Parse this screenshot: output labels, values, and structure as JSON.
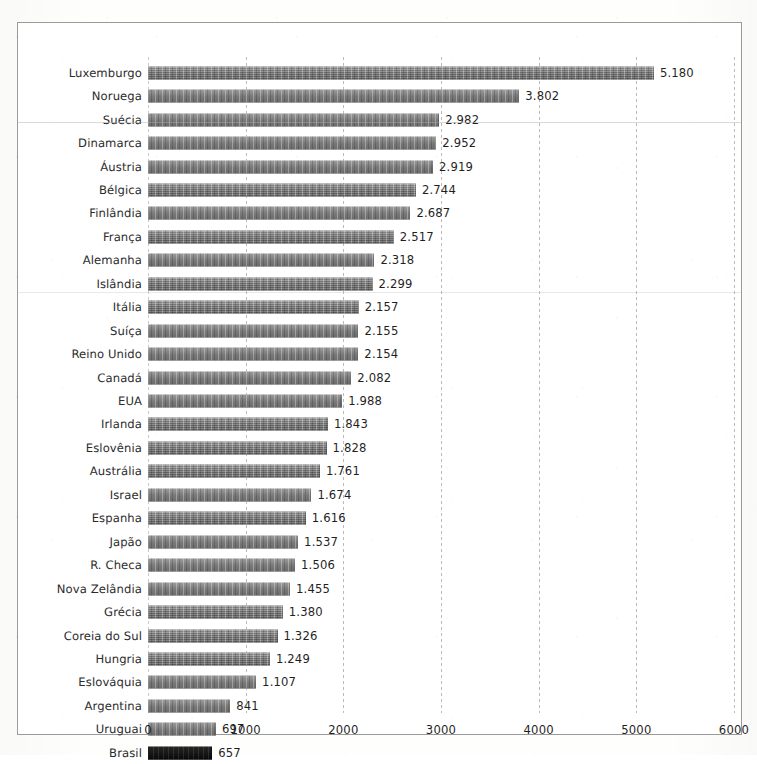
{
  "chart_data": {
    "type": "bar",
    "orientation": "horizontal",
    "title": "",
    "xlabel": "",
    "ylabel": "",
    "xlim": [
      0,
      6000
    ],
    "xticks": [
      "0",
      "1000",
      "2000",
      "3000",
      "4000",
      "5000",
      "6000"
    ],
    "xtick_values": [
      0,
      1000,
      2000,
      3000,
      4000,
      5000,
      6000
    ],
    "grid": true,
    "legend": "none",
    "highlight_category": "Brasil",
    "highlight_color": "#0d0d0d",
    "bar_color": "#7e7e7e",
    "categories": [
      "Luxemburgo",
      "Noruega",
      "Suécia",
      "Dinamarca",
      "Áustria",
      "Bélgica",
      "Finlândia",
      "França",
      "Alemanha",
      "Islândia",
      "Itália",
      "Suíça",
      "Reino Unido",
      "Canadá",
      "EUA",
      "Irlanda",
      "Eslovênia",
      "Austrália",
      "Israel",
      "Espanha",
      "Japão",
      "R. Checa",
      "Nova Zelândia",
      "Grécia",
      "Coreia do Sul",
      "Hungria",
      "Eslováquia",
      "Argentina",
      "Uruguai",
      "Brasil"
    ],
    "values": [
      5180,
      3802,
      2982,
      2952,
      2919,
      2744,
      2687,
      2517,
      2318,
      2299,
      2157,
      2155,
      2154,
      2082,
      1988,
      1843,
      1828,
      1761,
      1674,
      1616,
      1537,
      1506,
      1455,
      1380,
      1326,
      1249,
      1107,
      841,
      697,
      657
    ],
    "value_labels": [
      "5.180",
      "3.802",
      "2.982",
      "2.952",
      "2.919",
      "2.744",
      "2.687",
      "2.517",
      "2.318",
      "2.299",
      "2.157",
      "2.155",
      "2.154",
      "2.082",
      "1.988",
      "1.843",
      "1.828",
      "1.761",
      "1.674",
      "1.616",
      "1.537",
      "1.506",
      "1.455",
      "1.380",
      "1.326",
      "1.249",
      "1.107",
      "841",
      "697",
      "657"
    ]
  }
}
